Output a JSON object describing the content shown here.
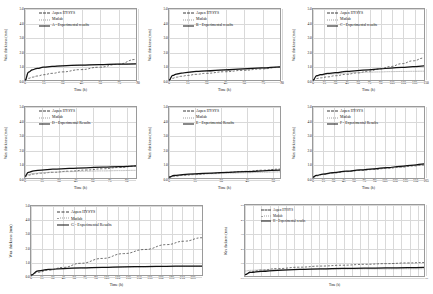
{
  "figure": {
    "series_names": {
      "aspen": "Aspen HYSYS",
      "matlab": "Matlab",
      "experimental_suffix_lower": "Experimental results",
      "experimental_suffix_title": "Experimental Results"
    },
    "axis_titles": {
      "x": "Time (h)",
      "y": "Wax thickness (mm)"
    },
    "colors": {
      "aspen": "#3a3a3a",
      "matlab": "#9e9e9e",
      "experimental": "#111111",
      "grid": "#d9d9d9",
      "axis": "#8c8c8c"
    }
  },
  "chart_data": [
    {
      "type": "line",
      "panel": "A",
      "title": "",
      "xlabel": "Time (h)",
      "ylabel": "Wax thickness (mm)",
      "xlim": [
        0,
        90
      ],
      "ylim": [
        0,
        5
      ],
      "xticks": [
        0,
        15,
        30,
        45,
        60,
        75,
        90
      ],
      "yticks": [
        "0.0",
        "1.0",
        "2.0",
        "3.0",
        "4.0",
        "5.0"
      ],
      "grid": true,
      "legend_position": "top-left",
      "legend": [
        "Aspen HYSYS",
        "Matlab",
        "A - Experimental results"
      ],
      "x": [
        0,
        3,
        6,
        10,
        15,
        22,
        30,
        45,
        60,
        75,
        90
      ],
      "series": [
        {
          "name": "Aspen HYSYS",
          "style": "dashed",
          "values": [
            0.0,
            0.12,
            0.2,
            0.28,
            0.37,
            0.47,
            0.57,
            0.73,
            0.9,
            1.1,
            1.45
          ]
        },
        {
          "name": "Matlab",
          "style": "dotted",
          "values": [
            0.0,
            0.55,
            0.72,
            0.82,
            0.9,
            0.96,
            1.0,
            1.05,
            1.08,
            1.11,
            1.14
          ]
        },
        {
          "name": "A - Experimental results",
          "style": "solid",
          "values": [
            0.0,
            0.55,
            0.72,
            0.82,
            0.9,
            0.96,
            1.0,
            1.05,
            1.08,
            1.11,
            1.14
          ]
        }
      ]
    },
    {
      "type": "line",
      "panel": "B",
      "xlabel": "Time (h)",
      "ylabel": "Wax thickness (mm)",
      "xlim": [
        0,
        90
      ],
      "ylim": [
        0,
        5
      ],
      "xticks": [
        0,
        15,
        30,
        45,
        60,
        75,
        90
      ],
      "yticks": [
        "0.0",
        "1.0",
        "2.0",
        "3.0",
        "4.0",
        "5.0"
      ],
      "grid": true,
      "legend_position": "top-left",
      "legend": [
        "Aspen HYSYS",
        "Matlab",
        "B - Experimental results"
      ],
      "x": [
        0,
        3,
        6,
        10,
        15,
        22,
        30,
        45,
        60,
        75,
        90
      ],
      "series": [
        {
          "name": "Aspen HYSYS",
          "style": "dashed",
          "values": [
            0.0,
            0.12,
            0.2,
            0.26,
            0.32,
            0.4,
            0.47,
            0.58,
            0.68,
            0.78,
            0.9
          ]
        },
        {
          "name": "Matlab",
          "style": "dotted",
          "values": [
            0.0,
            0.3,
            0.4,
            0.46,
            0.52,
            0.58,
            0.62,
            0.7,
            0.76,
            0.82,
            0.88
          ]
        },
        {
          "name": "B - Experimental results",
          "style": "solid",
          "values": [
            0.0,
            0.32,
            0.42,
            0.48,
            0.54,
            0.6,
            0.65,
            0.72,
            0.79,
            0.85,
            0.93
          ]
        }
      ]
    },
    {
      "type": "line",
      "panel": "C",
      "xlabel": "Time (h)",
      "ylabel": "Wax thickness (mm)",
      "xlim": [
        0,
        150
      ],
      "ylim": [
        0,
        5
      ],
      "xticks": [
        0,
        15,
        30,
        45,
        60,
        75,
        90,
        105,
        120,
        135,
        150
      ],
      "yticks": [
        "0.0",
        "1.0",
        "2.0",
        "3.0",
        "4.0",
        "5.0"
      ],
      "grid": true,
      "legend_position": "top-left",
      "legend": [
        "Aspen HYSYS",
        "Matlab",
        "C - Experimental results"
      ],
      "x": [
        0,
        5,
        10,
        20,
        30,
        45,
        60,
        75,
        90,
        105,
        120,
        135,
        150
      ],
      "series": [
        {
          "name": "Aspen HYSYS",
          "style": "dashed",
          "values": [
            0.0,
            0.1,
            0.15,
            0.22,
            0.3,
            0.4,
            0.5,
            0.62,
            0.78,
            0.95,
            1.15,
            1.35,
            1.55
          ]
        },
        {
          "name": "Matlab",
          "style": "dotted",
          "values": [
            0.0,
            0.26,
            0.33,
            0.4,
            0.44,
            0.49,
            0.52,
            0.55,
            0.57,
            0.59,
            0.6,
            0.61,
            0.62
          ]
        },
        {
          "name": "C - Experimental results",
          "style": "solid",
          "values": [
            0.0,
            0.3,
            0.38,
            0.46,
            0.52,
            0.6,
            0.66,
            0.72,
            0.78,
            0.84,
            0.89,
            0.94,
            0.99
          ]
        }
      ]
    },
    {
      "type": "line",
      "panel": "D",
      "xlabel": "Time (h)",
      "ylabel": "Wax thickness (mm)",
      "xlim": [
        0,
        100
      ],
      "ylim": [
        0,
        5
      ],
      "xticks": [
        0,
        15,
        30,
        45,
        60,
        75,
        90
      ],
      "yticks": [
        "0.0",
        "1.0",
        "2.0",
        "3.0",
        "4.0",
        "5.0"
      ],
      "grid": true,
      "legend_position": "top-left",
      "legend": [
        "Aspen HYSYS",
        "Matlab",
        "D - Experimental Results"
      ],
      "x": [
        0,
        3,
        8,
        15,
        25,
        40,
        55,
        70,
        85,
        100
      ],
      "series": [
        {
          "name": "Aspen HYSYS",
          "style": "dashed",
          "values": [
            0.1,
            0.2,
            0.28,
            0.34,
            0.4,
            0.48,
            0.56,
            0.65,
            0.74,
            0.84
          ]
        },
        {
          "name": "Matlab",
          "style": "dotted",
          "values": [
            0.1,
            0.25,
            0.32,
            0.37,
            0.41,
            0.45,
            0.48,
            0.5,
            0.52,
            0.54
          ]
        },
        {
          "name": "D - Experimental Results",
          "style": "solid",
          "values": [
            0.12,
            0.4,
            0.5,
            0.56,
            0.62,
            0.68,
            0.72,
            0.76,
            0.8,
            0.85
          ]
        }
      ]
    },
    {
      "type": "line",
      "panel": "E",
      "xlabel": "Time (h)",
      "ylabel": "Wax thickness (mm)",
      "xlim": [
        0,
        65
      ],
      "ylim": [
        0,
        5
      ],
      "xticks": [
        0,
        15,
        30,
        45,
        60
      ],
      "yticks": [
        "0.0",
        "1.0",
        "2.0",
        "3.0",
        "4.0",
        "5.0"
      ],
      "grid": true,
      "legend_position": "top-left",
      "legend": [
        "Aspen HYSYS",
        "Matlab",
        "E - Experimental Results"
      ],
      "x": [
        0,
        3,
        8,
        15,
        25,
        35,
        45,
        55,
        65
      ],
      "series": [
        {
          "name": "Aspen HYSYS",
          "style": "dashed",
          "values": [
            0.05,
            0.12,
            0.18,
            0.24,
            0.32,
            0.4,
            0.47,
            0.55,
            0.63
          ]
        },
        {
          "name": "Matlab",
          "style": "dotted",
          "values": [
            0.05,
            0.14,
            0.2,
            0.25,
            0.3,
            0.34,
            0.37,
            0.4,
            0.43
          ]
        },
        {
          "name": "E - Experimental Results",
          "style": "solid",
          "values": [
            0.06,
            0.18,
            0.24,
            0.29,
            0.35,
            0.4,
            0.45,
            0.5,
            0.56
          ]
        }
      ]
    },
    {
      "type": "line",
      "panel": "F",
      "xlabel": "Time (h)",
      "ylabel": "Wax thickness (mm)",
      "xlim": [
        0,
        165
      ],
      "ylim": [
        0,
        5
      ],
      "xticks": [
        0,
        15,
        30,
        45,
        60,
        75,
        90,
        105,
        120,
        135,
        150,
        165
      ],
      "yticks": [
        "0.0",
        "1.0",
        "2.0",
        "3.0",
        "4.0",
        "5.0"
      ],
      "grid": true,
      "legend_position": "top-left",
      "legend": [
        "Aspen HYSYS",
        "Matlab",
        "F - Experimental Results"
      ],
      "x": [
        0,
        5,
        15,
        30,
        50,
        70,
        90,
        110,
        130,
        150,
        165
      ],
      "series": [
        {
          "name": "Aspen HYSYS",
          "style": "dashed",
          "values": [
            0.05,
            0.15,
            0.25,
            0.35,
            0.45,
            0.53,
            0.6,
            0.68,
            0.76,
            0.85,
            0.92
          ]
        },
        {
          "name": "Matlab",
          "style": "dotted",
          "values": [
            0.05,
            0.16,
            0.26,
            0.36,
            0.46,
            0.54,
            0.62,
            0.7,
            0.78,
            0.87,
            0.95
          ]
        },
        {
          "name": "F - Experimental Results",
          "style": "solid",
          "values": [
            0.06,
            0.18,
            0.28,
            0.38,
            0.48,
            0.57,
            0.65,
            0.73,
            0.82,
            0.91,
            1.0
          ]
        }
      ]
    },
    {
      "type": "line",
      "panel": "G",
      "xlabel": "Time (h)",
      "ylabel": "Wax thickness (mm)",
      "xlim": [
        0,
        240
      ],
      "ylim": [
        0,
        5
      ],
      "xticks": [
        0,
        15,
        30,
        45,
        60,
        75,
        90,
        105,
        120,
        135,
        150,
        165,
        180,
        195,
        210,
        225
      ],
      "yticks": [
        "0.0",
        "1.0",
        "2.0",
        "3.0",
        "4.0",
        "5.0"
      ],
      "grid": true,
      "legend_position": "top-left",
      "legend": [
        "Aspen HYSYS",
        "Matlab",
        "G - Experimental Results"
      ],
      "x": [
        0,
        10,
        25,
        45,
        70,
        100,
        130,
        160,
        190,
        215,
        240
      ],
      "series": [
        {
          "name": "Aspen HYSYS",
          "style": "dashed",
          "values": [
            0.0,
            0.2,
            0.35,
            0.55,
            0.85,
            1.2,
            1.55,
            1.85,
            2.2,
            2.45,
            2.7
          ]
        },
        {
          "name": "Matlab",
          "style": "dotted",
          "values": [
            0.0,
            0.28,
            0.38,
            0.45,
            0.5,
            0.54,
            0.57,
            0.59,
            0.61,
            0.62,
            0.63
          ]
        },
        {
          "name": "G - Experimental Results",
          "style": "solid",
          "values": [
            0.0,
            0.3,
            0.4,
            0.47,
            0.52,
            0.56,
            0.59,
            0.61,
            0.63,
            0.64,
            0.65
          ]
        }
      ]
    },
    {
      "type": "line",
      "panel": "H",
      "xlabel": "Time (h)",
      "ylabel": "Wax thickness (mm)",
      "xlim": [
        0,
        330
      ],
      "ylim": [
        0,
        5
      ],
      "xticks": [
        0,
        15,
        30,
        45,
        60,
        75,
        90,
        105,
        120,
        135,
        150,
        165,
        180,
        195,
        210,
        225,
        240,
        255,
        270,
        285,
        300,
        315,
        330
      ],
      "yticks": [
        "0.0",
        "1.0",
        "2.0",
        "3.0",
        "4.0",
        "5.0"
      ],
      "grid": true,
      "legend_position": "top-left",
      "legend": [
        "Aspen HYSYS",
        "Matlab",
        "H - Experimental results"
      ],
      "x": [
        0,
        10,
        30,
        60,
        100,
        140,
        180,
        220,
        260,
        300,
        330
      ],
      "series": [
        {
          "name": "Aspen HYSYS",
          "style": "dashed",
          "values": [
            0.1,
            0.3,
            0.42,
            0.52,
            0.62,
            0.7,
            0.76,
            0.82,
            0.87,
            0.92,
            0.95
          ]
        },
        {
          "name": "Matlab",
          "style": "dotted",
          "values": [
            0.35,
            0.4,
            0.43,
            0.45,
            0.47,
            0.48,
            0.49,
            0.5,
            0.5,
            0.51,
            0.51
          ]
        },
        {
          "name": "H - Experimental results",
          "style": "solid",
          "values": [
            0.1,
            0.25,
            0.33,
            0.4,
            0.46,
            0.5,
            0.53,
            0.55,
            0.57,
            0.59,
            0.6
          ]
        }
      ]
    }
  ]
}
